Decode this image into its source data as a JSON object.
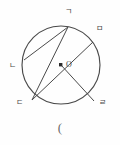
{
  "figure": {
    "type": "circle-geometry-diagram",
    "background_color": "#fefefe",
    "stroke_color": "#4a4a4a",
    "circle": {
      "center_x": 61,
      "center_y": 65,
      "radius": 39,
      "center_label": "O"
    },
    "points": [
      {
        "id": "giyeok",
        "label": "ㄱ",
        "x": 68,
        "y": 27,
        "label_x": 65,
        "label_y": 8
      },
      {
        "id": "mieum",
        "label": "ㅁ",
        "x": 93,
        "y": 42,
        "label_x": 96,
        "label_y": 25
      },
      {
        "id": "nieun",
        "label": "ㄴ",
        "x": 24,
        "y": 60,
        "label_x": 9,
        "label_y": 62
      },
      {
        "id": "digeut",
        "label": "ㄷ",
        "x": 32,
        "y": 100,
        "label_x": 16,
        "label_y": 99
      },
      {
        "id": "rieul",
        "label": "ㄹ",
        "x": 94,
        "y": 101,
        "label_x": 99,
        "label_y": 99
      }
    ],
    "segments": [
      {
        "id": "chord-giyeok-nieun",
        "from": "giyeok",
        "to": "nieun"
      },
      {
        "id": "chord-giyeok-digeut",
        "from": "giyeok",
        "to": "digeut"
      },
      {
        "id": "diameter-digeut-mieum",
        "from": "digeut",
        "to": "mieum"
      },
      {
        "id": "radius-center-rieul",
        "from": "center",
        "to": "rieul"
      }
    ],
    "caption": "(",
    "caption_y": 121
  }
}
